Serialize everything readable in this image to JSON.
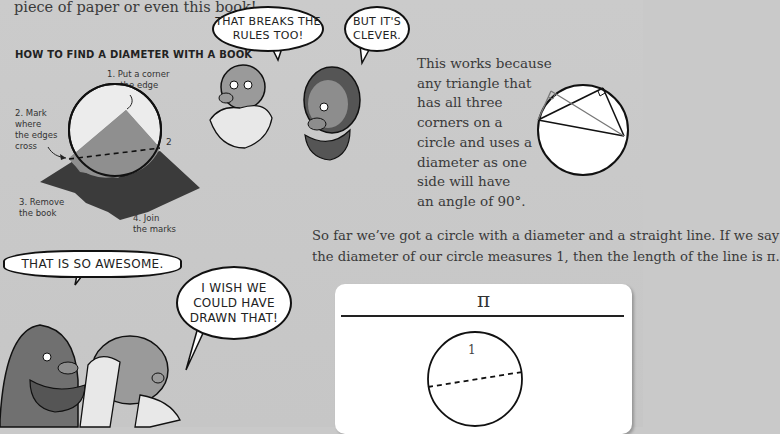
{
  "intro_text_end": "piece of paper or even this book!",
  "diagram": {
    "heading": "HOW TO FIND A DIAMETER WITH A BOOK",
    "steps": [
      "1. Put a corner on the edge",
      "2. Mark where the edges cross",
      "3. Remove the book",
      "4. Join the marks"
    ],
    "step1_lines": [
      "1. Put a corner",
      "on the edge"
    ],
    "step2_lines": [
      "2. Mark",
      "where",
      "the edges",
      "cross"
    ],
    "step3_lines": [
      "3. Remove",
      "the book"
    ],
    "step4_lines": [
      "4. Join",
      "the marks"
    ],
    "mark_label": "2"
  },
  "bubbles": {
    "breaks_rules": [
      "THAT BREAKS THE",
      "RULES TOO!"
    ],
    "clever": [
      "BUT IT'S",
      "CLEVER."
    ],
    "awesome": "THAT IS SO AWESOME.",
    "wish": [
      "I WISH WE",
      "COULD HAVE",
      "DRAWN THAT!"
    ]
  },
  "explanation_lines": [
    "This works because",
    "any triangle that",
    "has all three",
    "corners on a",
    "circle and uses a",
    "diameter as one",
    "side will have",
    "an angle of 90°."
  ],
  "summary_lines": [
    "So far we’ve got a circle with a diameter and a straight line. If we say",
    "the diameter of our circle measures 1, then the length of the line is π."
  ],
  "card": {
    "line_label": "π",
    "diameter_label": "1"
  },
  "colors": {
    "page_bg": "#c9c9c9",
    "book_dark": "#3b3b3b",
    "book_mid": "#8a8a8a",
    "circle_fill": "#ececec"
  }
}
